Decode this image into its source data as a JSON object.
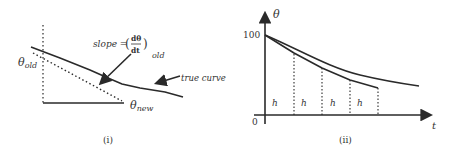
{
  "panel_i": {
    "caption": "(i)",
    "theta_old_main": "θ",
    "theta_old_sub": "old",
    "theta_new_main": "θ",
    "theta_new_sub": "new",
    "slope_label": "slope =",
    "slope_num": "dθ",
    "slope_den": "dt",
    "slope_sub": "old",
    "true_curve_label": "true curve"
  },
  "panel_ii": {
    "caption": "(ii)",
    "y_axis_label": "θ",
    "x_axis_label": "t",
    "y_tick_100": "100",
    "origin_label": "0",
    "step_labels": [
      "h",
      "h",
      "h",
      "h"
    ]
  },
  "colors": {
    "line": "#2a2a2a",
    "text": "#333333"
  }
}
